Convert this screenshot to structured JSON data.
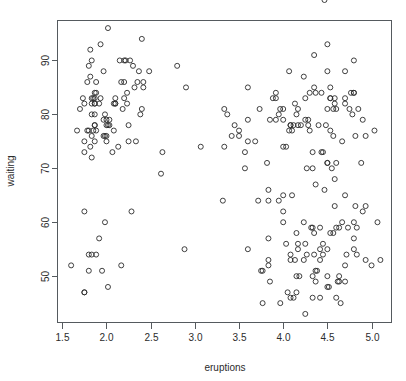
{
  "chart_data": {
    "type": "scatter",
    "title": "",
    "xlabel": "eruptions",
    "ylabel": "waiting",
    "xlim": [
      1.44,
      5.22
    ],
    "ylim": [
      41.5,
      97.5
    ],
    "xticks": [
      1.5,
      2.0,
      2.5,
      3.0,
      3.5,
      4.0,
      4.5,
      5.0
    ],
    "xtick_labels": [
      "1.5",
      "2.0",
      "2.5",
      "3.0",
      "3.5",
      "4.0",
      "4.5",
      "5.0"
    ],
    "yticks": [
      50,
      60,
      70,
      80,
      90
    ],
    "ytick_labels": [
      "50",
      "60",
      "70",
      "80",
      "90"
    ],
    "grid": false,
    "legend": null,
    "marker": "open-circle",
    "marker_color": "#2b2b2b",
    "n_points": 272,
    "x": [
      3.6,
      1.8,
      3.333,
      2.283,
      4.533,
      2.883,
      4.7,
      3.6,
      1.95,
      4.35,
      1.833,
      3.917,
      4.2,
      1.75,
      4.7,
      2.167,
      1.75,
      4.8,
      1.6,
      4.25,
      1.8,
      1.75,
      3.45,
      3.067,
      4.533,
      3.6,
      1.967,
      4.083,
      3.85,
      4.433,
      4.3,
      4.467,
      3.367,
      4.033,
      3.833,
      2.017,
      1.867,
      4.833,
      1.833,
      4.783,
      4.35,
      1.883,
      4.567,
      1.75,
      4.533,
      3.317,
      3.833,
      2.1,
      4.633,
      2.0,
      4.8,
      4.716,
      1.833,
      4.833,
      1.733,
      4.883,
      3.717,
      1.667,
      4.567,
      4.317,
      2.233,
      4.5,
      1.75,
      4.8,
      1.817,
      4.4,
      4.167,
      4.7,
      2.067,
      4.7,
      4.033,
      1.967,
      4.5,
      4.0,
      1.983,
      5.067,
      2.017,
      4.567,
      3.883,
      3.6,
      4.133,
      4.333,
      4.1,
      2.633,
      4.067,
      4.933,
      3.95,
      4.517,
      2.167,
      4.0,
      2.2,
      4.333,
      1.867,
      4.817,
      1.833,
      4.3,
      4.667,
      3.75,
      1.867,
      4.9,
      2.483,
      4.367,
      2.1,
      4.5,
      4.05,
      1.867,
      4.7,
      1.783,
      4.85,
      3.683,
      4.733,
      2.3,
      4.9,
      4.417,
      1.7,
      4.633,
      2.317,
      4.6,
      1.817,
      4.417,
      2.617,
      4.067,
      4.25,
      1.967,
      4.6,
      3.767,
      1.917,
      4.5,
      2.267,
      4.65,
      1.867,
      4.167,
      2.8,
      4.333,
      1.833,
      4.383,
      1.883,
      4.933,
      2.033,
      3.733,
      4.233,
      2.233,
      4.533,
      4.817,
      4.333,
      1.983,
      4.633,
      2.017,
      5.1,
      1.8,
      5.033,
      4.0,
      2.4,
      4.6,
      3.567,
      4.0,
      4.5,
      4.083,
      1.8,
      3.967,
      2.2,
      4.15,
      2.0,
      3.833,
      3.5,
      4.583,
      2.367,
      5.0,
      1.933,
      4.617,
      1.917,
      2.083,
      4.583,
      3.333,
      4.167,
      4.333,
      4.5,
      2.417,
      4.0,
      4.167,
      1.883,
      4.583,
      4.25,
      3.767,
      2.033,
      4.433,
      4.083,
      1.833,
      4.417,
      2.183,
      4.8,
      1.833,
      4.8,
      4.1,
      3.966,
      4.233,
      3.5,
      4.366,
      2.25,
      4.667,
      2.1,
      4.35,
      4.133,
      1.867,
      4.6,
      1.783,
      4.367,
      3.85,
      1.933,
      4.5,
      2.383,
      4.7,
      1.867,
      3.833,
      3.417,
      4.233,
      2.4,
      4.8,
      2.0,
      4.15,
      1.867,
      4.267,
      1.75,
      4.483,
      4.0,
      4.117,
      4.083,
      4.267,
      3.917,
      4.55,
      4.083,
      2.417,
      4.183,
      2.217,
      4.45,
      1.883,
      1.85,
      4.283,
      3.95,
      2.333,
      4.15,
      2.35,
      4.933,
      2.9,
      4.583,
      3.833,
      2.083,
      4.367,
      2.133,
      4.35,
      2.2,
      4.45,
      3.567,
      4.5,
      4.15,
      3.817,
      3.917,
      4.45,
      2.0,
      4.283,
      4.767,
      4.533,
      1.85,
      4.25,
      1.983,
      2.25,
      4.75,
      4.117,
      2.15,
      4.417,
      1.817,
      4.467
    ],
    "y": [
      79,
      54,
      74,
      62,
      85,
      55,
      88,
      85,
      51,
      85,
      54,
      84,
      78,
      47,
      83,
      52,
      62,
      84,
      52,
      79,
      51,
      47,
      78,
      74,
      83,
      55,
      76,
      78,
      79,
      73,
      77,
      66,
      80,
      74,
      52,
      48,
      80,
      59,
      90,
      80,
      58,
      84,
      58,
      73,
      83,
      64,
      53,
      82,
      59,
      75,
      90,
      54,
      80,
      54,
      83,
      71,
      64,
      77,
      81,
      59,
      84,
      48,
      82,
      60,
      92,
      78,
      78,
      65,
      73,
      82,
      56,
      79,
      71,
      62,
      76,
      60,
      78,
      76,
      83,
      75,
      82,
      70,
      65,
      73,
      88,
      76,
      80,
      48,
      86,
      60,
      90,
      50,
      78,
      63,
      72,
      84,
      75,
      51,
      82,
      62,
      88,
      49,
      83,
      81,
      47,
      84,
      52,
      86,
      81,
      75,
      59,
      89,
      79,
      59,
      81,
      50,
      85,
      59,
      87,
      53,
      69,
      77,
      56,
      88,
      81,
      45,
      82,
      55,
      90,
      45,
      83,
      56,
      89,
      46,
      82,
      51,
      86,
      53,
      79,
      81,
      60,
      82,
      77,
      76,
      59,
      80,
      49,
      96,
      53,
      77,
      77,
      65,
      81,
      71,
      70,
      81,
      93,
      53,
      89,
      45,
      86,
      58,
      78,
      66,
      76,
      63,
      88,
      52,
      93,
      49,
      57,
      77,
      68,
      81,
      81,
      73,
      50,
      85,
      74,
      55,
      77,
      83,
      83,
      51,
      78,
      84,
      46,
      83,
      55,
      81,
      57,
      76,
      84,
      77,
      81,
      87,
      77,
      51,
      78,
      60,
      82,
      91,
      53,
      78,
      46,
      77,
      84,
      49,
      83,
      71,
      80,
      49,
      75,
      64,
      76,
      53,
      94,
      55,
      76,
      50,
      82,
      54,
      75,
      78,
      79,
      78,
      78,
      70,
      79,
      70,
      54,
      86,
      50,
      90,
      54,
      54,
      77,
      79,
      64,
      75,
      47,
      86,
      63,
      85,
      82,
      57,
      82,
      67,
      74,
      54,
      83,
      73,
      73,
      88,
      80,
      71,
      83,
      56,
      79,
      78,
      84,
      58,
      83,
      43,
      60,
      75,
      81,
      46,
      90,
      46,
      74
    ],
    "frame": {
      "x0": 57,
      "y0": 20,
      "x1": 391,
      "y1": 322
    },
    "axis_color": "#555a5e",
    "background": "#ffffff"
  },
  "axis": {
    "x_title": "eruptions",
    "y_title": "waiting"
  }
}
